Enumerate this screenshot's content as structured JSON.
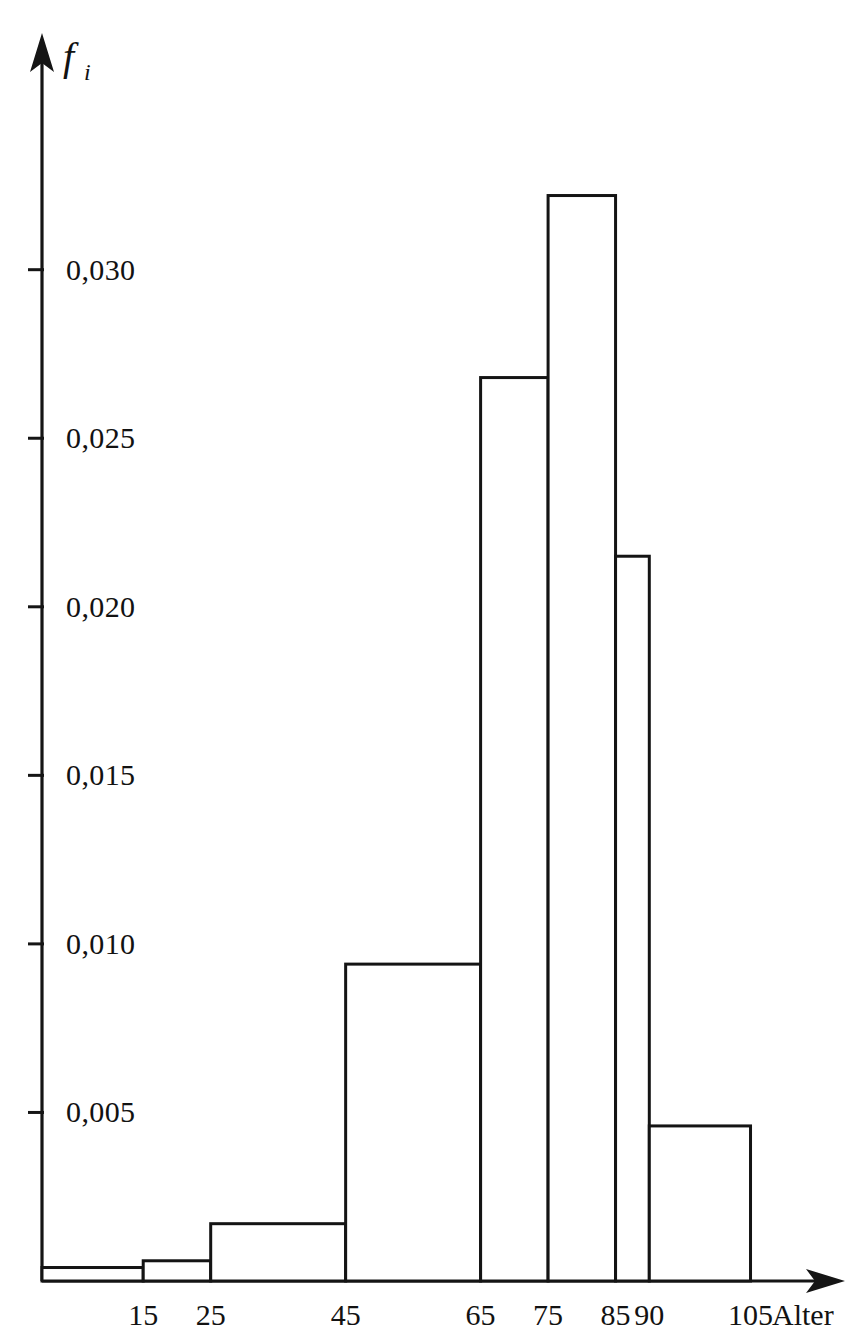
{
  "chart_data": {
    "type": "bar",
    "title": "",
    "subtitle": "",
    "xlabel": "Alter",
    "ylabel": "f_i",
    "ylabel_display": "f",
    "ylabel_subscript": "i",
    "grid": false,
    "legend": null,
    "xlim": [
      0,
      115
    ],
    "ylim": [
      0,
      0.0345
    ],
    "x_tick_labels": [
      "15",
      "25",
      "45",
      "65",
      "75",
      "85",
      "90",
      "105"
    ],
    "x_tick_values": [
      15,
      25,
      45,
      65,
      75,
      85,
      90,
      105
    ],
    "y_tick_labels": [
      "0,005",
      "0,010",
      "0,015",
      "0,020",
      "0,025",
      "0,030"
    ],
    "y_tick_values": [
      0.005,
      0.01,
      0.015,
      0.02,
      0.025,
      0.03
    ],
    "bin_edges": [
      0,
      15,
      25,
      45,
      65,
      75,
      85,
      90,
      105
    ],
    "categories": [
      "0-15",
      "15-25",
      "25-45",
      "45-65",
      "65-75",
      "75-85",
      "85-90",
      "90-105"
    ],
    "values": [
      0.0004,
      0.0006,
      0.0017,
      0.0094,
      0.0268,
      0.0322,
      0.0215,
      0.0046
    ],
    "bars": [
      {
        "label": "0-15",
        "x0": 0,
        "x1": 15,
        "height": 0.0004
      },
      {
        "label": "15-25",
        "x0": 15,
        "x1": 25,
        "height": 0.0006
      },
      {
        "label": "25-45",
        "x0": 25,
        "x1": 45,
        "height": 0.0017
      },
      {
        "label": "45-65",
        "x0": 45,
        "x1": 65,
        "height": 0.0094
      },
      {
        "label": "65-75",
        "x0": 65,
        "x1": 75,
        "height": 0.0268
      },
      {
        "label": "75-85",
        "x0": 75,
        "x1": 85,
        "height": 0.0322
      },
      {
        "label": "85-90",
        "x0": 85,
        "x1": 90,
        "height": 0.0215
      },
      {
        "label": "90-105",
        "x0": 90,
        "x1": 105,
        "height": 0.0046
      }
    ],
    "colors": {
      "bar_fill": "#ffffff",
      "bar_stroke": "#141414",
      "axis": "#151515",
      "text": "#121212",
      "background": "#ffffff"
    }
  }
}
